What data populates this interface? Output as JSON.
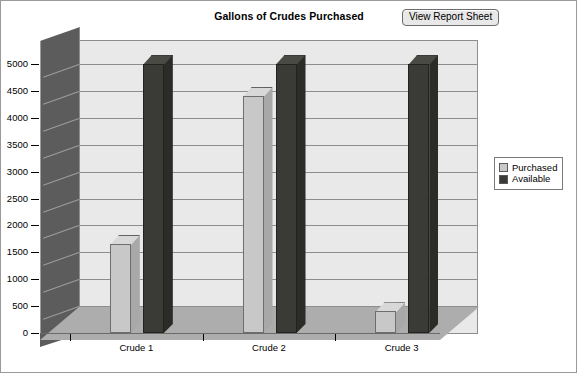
{
  "header": {
    "title": "Gallons of Crudes Purchased",
    "button_label": "View Report Sheet"
  },
  "legend": {
    "items": [
      {
        "label": "Purchased",
        "color": "#c8c8c8"
      },
      {
        "label": "Available",
        "color": "#3a3a36"
      }
    ]
  },
  "axis": {
    "y_ticks": [
      "5000",
      "4500",
      "4000",
      "3500",
      "3000",
      "2500",
      "2000",
      "1500",
      "1000",
      "500",
      "0"
    ],
    "x_ticks": [
      "Crude 1",
      "Crude 2",
      "Crude 3"
    ]
  },
  "chart_data": {
    "type": "bar",
    "title": "Gallons of Crudes Purchased",
    "xlabel": "",
    "ylabel": "",
    "ylim": [
      0,
      5000
    ],
    "ytick_step": 500,
    "grid": true,
    "legend_position": "right",
    "three_d": true,
    "categories": [
      "Crude 1",
      "Crude 2",
      "Crude 3"
    ],
    "series": [
      {
        "name": "Purchased",
        "color": "#c8c8c8",
        "values": [
          1650,
          4400,
          400
        ]
      },
      {
        "name": "Available",
        "color": "#3a3a36",
        "values": [
          5000,
          5000,
          5000
        ]
      }
    ]
  }
}
